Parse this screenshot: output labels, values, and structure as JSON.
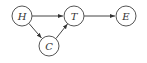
{
  "diagram": {
    "type": "directed-graph",
    "nodes": [
      {
        "id": "H",
        "label": "H"
      },
      {
        "id": "T",
        "label": "T"
      },
      {
        "id": "C",
        "label": "C"
      },
      {
        "id": "E",
        "label": "E"
      }
    ],
    "edges": [
      {
        "from": "H",
        "to": "T"
      },
      {
        "from": "H",
        "to": "C"
      },
      {
        "from": "C",
        "to": "T"
      },
      {
        "from": "T",
        "to": "E"
      }
    ]
  },
  "colors": {
    "stroke": "#555555",
    "text": "#333333",
    "background": "#ffffff"
  }
}
